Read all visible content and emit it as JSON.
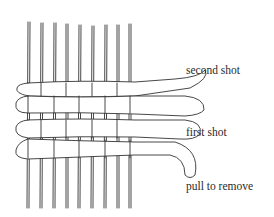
{
  "diagram": {
    "labels": {
      "second_shot": "second shot",
      "first_shot": "first shot",
      "pull_to_remove": "pull to remove"
    },
    "warp_count": 9,
    "colors": {
      "line": "#333333",
      "background": "#ffffff"
    }
  }
}
